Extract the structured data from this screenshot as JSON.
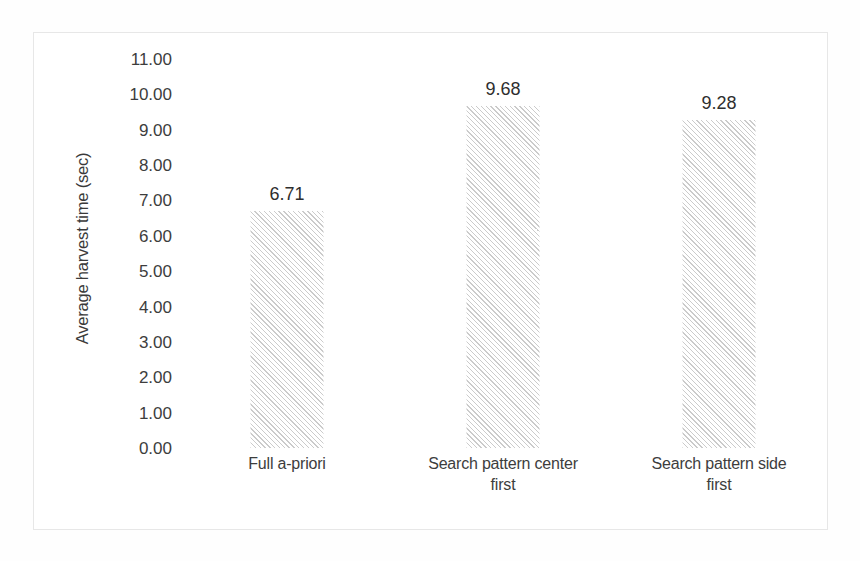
{
  "chart_data": {
    "type": "bar",
    "title": "",
    "subtitle": "",
    "xlabel": "",
    "ylabel": "Average harvest time (sec)",
    "categories": [
      "Full a-priori",
      "Search pattern center first",
      "Search pattern side first"
    ],
    "category_lines": [
      [
        "Full a-priori"
      ],
      [
        "Search pattern center",
        "first"
      ],
      [
        "Search pattern side",
        "first"
      ]
    ],
    "values": [
      6.71,
      9.68,
      9.28
    ],
    "data_labels": [
      "6.71",
      "9.68",
      "9.28"
    ],
    "ylim": [
      0,
      11
    ],
    "ytick_step": 1,
    "ytick_labels": [
      "11.00",
      "10.00",
      "9.00",
      "8.00",
      "7.00",
      "6.00",
      "5.00",
      "4.00",
      "3.00",
      "2.00",
      "1.00",
      "0.00"
    ],
    "ytick_values": [
      11,
      10,
      9,
      8,
      7,
      6,
      5,
      4,
      3,
      2,
      1,
      0
    ],
    "grid": false,
    "legend": false,
    "legend_position": "none",
    "bar_fill": "diagonal-hatch",
    "bar_color": "#a0a0a0",
    "background_color": "#ffffff",
    "frame_color": "#e7e7e7",
    "text_color": "#3d3d3d"
  }
}
